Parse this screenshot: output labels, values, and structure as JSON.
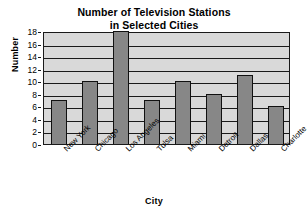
{
  "chart_data": {
    "type": "bar",
    "title": "Number of Television Stations in Selected Cities",
    "title_lines": [
      "Number of Television Stations",
      "in Selected Cities"
    ],
    "xlabel": "City",
    "ylabel": "Number",
    "categories": [
      "New York",
      "Chicago",
      "Los Angeles",
      "Tulsa",
      "Miami",
      "Detroit",
      "Dallas",
      "Charlotte"
    ],
    "values": [
      7,
      10,
      18,
      7,
      10,
      8,
      11,
      6
    ],
    "ylim": [
      0,
      18
    ],
    "ytick_step": 2,
    "yticks": [
      0,
      2,
      4,
      6,
      8,
      10,
      12,
      14,
      16,
      18
    ],
    "ytick_labels": [
      "0",
      "2",
      "4",
      "6",
      "8",
      "10",
      "12",
      "14",
      "16",
      "18"
    ],
    "grid": true,
    "grid_axis": "y",
    "legend": false,
    "bar_color": "#878787",
    "bar_edge_color": "#111111",
    "plot_background": "#d9d9d9",
    "axis_color": "#1a1a1a",
    "page_background": "#ffffff"
  }
}
